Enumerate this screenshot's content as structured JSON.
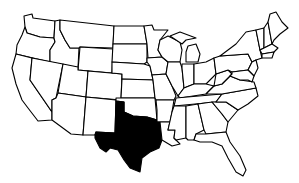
{
  "map": {
    "title": "United States map with Texas highlighted",
    "highlighted_state": "Texas",
    "highlight_color": "#000000",
    "fill_color": "#ffffff",
    "border_color": "#000000"
  }
}
